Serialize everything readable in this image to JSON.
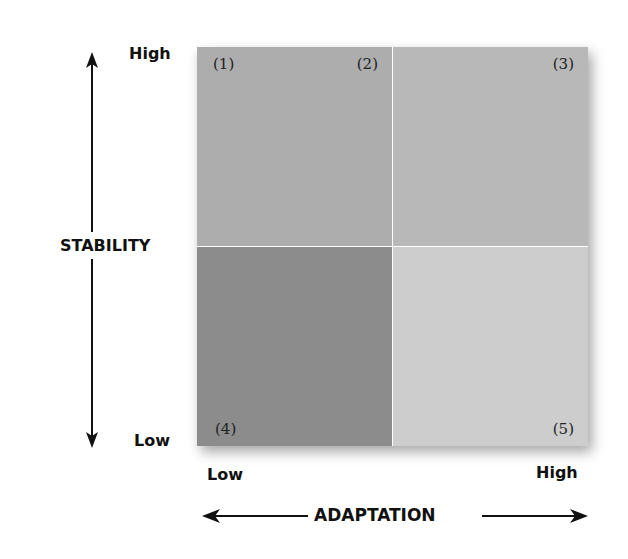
{
  "axes": {
    "y": {
      "title": "STABILITY",
      "high": "High",
      "low": "Low"
    },
    "x": {
      "title": "ADAPTATION",
      "low": "Low",
      "high": "High"
    }
  },
  "quadrants": {
    "top_left": {
      "labels": [
        "(1)",
        "(2)"
      ],
      "color": "#adadad"
    },
    "top_right": {
      "labels": [
        "(3)"
      ],
      "color": "#b8b8b8"
    },
    "bottom_left": {
      "labels": [
        "(4)"
      ],
      "color": "#8c8c8c"
    },
    "bottom_right": {
      "labels": [
        "(5)"
      ],
      "color": "#cdcdcd"
    }
  },
  "colors": {
    "arrow": "#111111",
    "divider": "#e4e4e4"
  }
}
